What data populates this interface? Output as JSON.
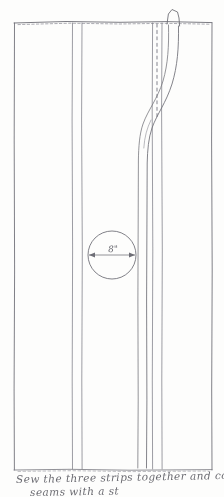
{
  "drawing": {
    "title": "Sewing pattern sketch - three strips",
    "medium": "pencil line drawing on white paper",
    "paper_color": "#fdfdfc",
    "ink_color": "#5a5a63"
  },
  "panel": {
    "left_edge_x": 14,
    "right_edge_x": 212,
    "top_edge_y": 22,
    "bottom_edge_y": 470,
    "top_edge_style": "dashed stitch line",
    "bottom_edge_style": "dashed stitch line"
  },
  "seams": [
    {
      "name": "seam-left",
      "x1": 72,
      "x2": 82
    },
    {
      "name": "seam-right",
      "x1": 152,
      "x2": 162
    }
  ],
  "flap": {
    "name": "top-tab",
    "x": 166,
    "width": 14,
    "height": 14,
    "description": "small raised tab above top edge"
  },
  "drape": {
    "name": "draped-strip-curve",
    "description": "S-curve sweeping from top right tab, curving left then running vertical to bottom"
  },
  "circle": {
    "center_x": 112,
    "center_y": 255,
    "radius": 24,
    "dimension_label": "8\"",
    "dimension_type": "diameter",
    "arrow_style": "double-headed"
  },
  "caption": {
    "line_1": "Sew the three strips together and cover",
    "line_2": "seams with a st",
    "line_2_clipped": true
  }
}
